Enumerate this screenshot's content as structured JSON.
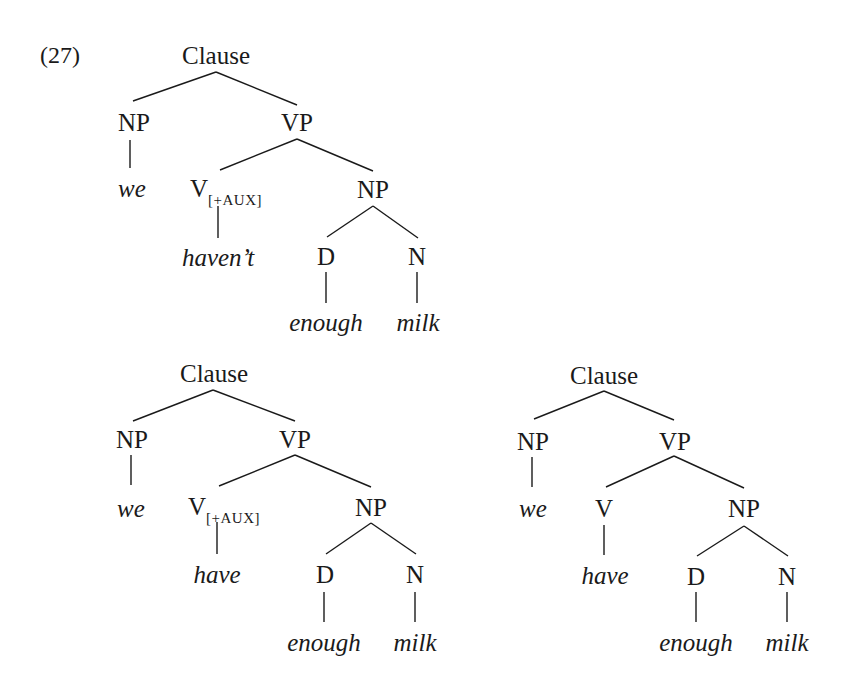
{
  "example_number": "(27)",
  "trees": [
    {
      "id": "tree-haven't",
      "nodes": {
        "clause": "Clause",
        "np_subj": "NP",
        "vp": "VP",
        "v": "V",
        "v_feature": "[+AUX]",
        "np_obj": "NP",
        "d": "D",
        "n": "N"
      },
      "words": {
        "subj": "we",
        "verb": "haven’t",
        "det": "enough",
        "noun": "milk"
      }
    },
    {
      "id": "tree-have-aux",
      "nodes": {
        "clause": "Clause",
        "np_subj": "NP",
        "vp": "VP",
        "v": "V",
        "v_feature": "[+AUX]",
        "np_obj": "NP",
        "d": "D",
        "n": "N"
      },
      "words": {
        "subj": "we",
        "verb": "have",
        "det": "enough",
        "noun": "milk"
      }
    },
    {
      "id": "tree-have-main",
      "nodes": {
        "clause": "Clause",
        "np_subj": "NP",
        "vp": "VP",
        "v": "V",
        "np_obj": "NP",
        "d": "D",
        "n": "N"
      },
      "words": {
        "subj": "we",
        "verb": "have",
        "det": "enough",
        "noun": "milk"
      }
    }
  ]
}
